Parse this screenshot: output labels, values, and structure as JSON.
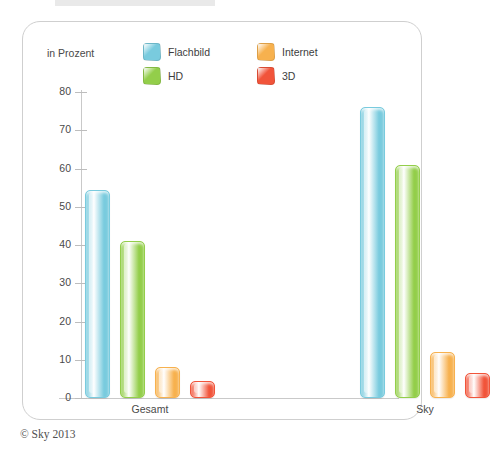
{
  "card": {
    "axis_unit_label": "in Prozent"
  },
  "legend": {
    "items": [
      {
        "label": "Flachbild",
        "color": "#79cbde"
      },
      {
        "label": "HD",
        "color": "#93ce4a"
      },
      {
        "label": "Internet",
        "color": "#f7b14e"
      },
      {
        "label": "3D",
        "color": "#f1543a"
      }
    ]
  },
  "footer": {
    "credit": "© Sky 2013"
  },
  "chart_data": {
    "type": "bar",
    "title": "",
    "subtitle": "",
    "xlabel": "",
    "ylabel": "in Prozent",
    "ylim": [
      0,
      80
    ],
    "yticks": [
      0,
      10,
      20,
      30,
      40,
      50,
      60,
      70,
      80
    ],
    "ytick_labels": [
      "0",
      "10",
      "20",
      "30",
      "40",
      "50",
      "60",
      "70",
      "80"
    ],
    "grid": false,
    "legend_position": "top",
    "categories": [
      "Gesamt",
      "Sky"
    ],
    "series": [
      {
        "name": "Flachbild",
        "color": "#79cbde",
        "values": [
          54.5,
          76
        ]
      },
      {
        "name": "HD",
        "color": "#93ce4a",
        "values": [
          41,
          61
        ]
      },
      {
        "name": "Internet",
        "color": "#f7b14e",
        "values": [
          8,
          12
        ]
      },
      {
        "name": "3D",
        "color": "#f1543a",
        "values": [
          4.5,
          6.5
        ]
      }
    ]
  }
}
